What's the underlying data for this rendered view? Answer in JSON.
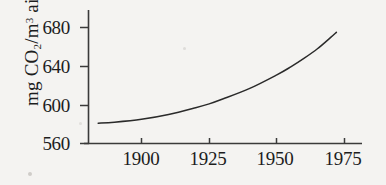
{
  "figure": {
    "background_color": "#f4f3f1",
    "ink_color": "#2a2a2a"
  },
  "chart_data": {
    "type": "line",
    "title": "",
    "subtitle": "",
    "xlabel": "",
    "ylabel": "mg CO2/m3 air",
    "ylabel_parts": {
      "prefix": "mg CO",
      "sub": "2",
      "slash": "/m",
      "sup": "3",
      "suffix": " air"
    },
    "xlim": [
      1884,
      1980
    ],
    "ylim": [
      560,
      692
    ],
    "xticks": [
      1900,
      1925,
      1950,
      1975
    ],
    "xtick_labels": [
      "1900",
      "1925",
      "1950",
      "1975"
    ],
    "yticks": [
      560,
      600,
      640,
      680
    ],
    "ytick_labels": [
      "560",
      "600",
      "640",
      "680"
    ],
    "grid": false,
    "legend": null,
    "series": [
      {
        "name": "CO2 concentration",
        "x": [
          1884,
          1890,
          1900,
          1910,
          1920,
          1925,
          1930,
          1940,
          1950,
          1955,
          1960,
          1965,
          1970,
          1972
        ],
        "y": [
          581,
          582,
          585,
          590,
          597,
          601,
          606,
          617,
          631,
          639,
          648,
          658,
          670,
          675
        ]
      }
    ]
  }
}
